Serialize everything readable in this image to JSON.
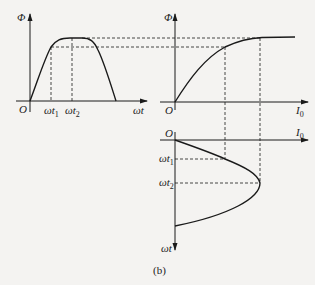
{
  "figure": {
    "caption": "(b)",
    "left_plot": {
      "y_label": "Φ",
      "x_label": "ωt",
      "origin_label": "O",
      "tick1": {
        "base": "ωt",
        "sub": "1"
      },
      "tick2": {
        "base": "ωt",
        "sub": "2"
      }
    },
    "right_top_plot": {
      "y_label": "Φ",
      "x_label_base": "I",
      "x_label_sub": "0",
      "origin_label": "O"
    },
    "right_bottom_plot": {
      "x_label_base": "I",
      "x_label_sub": "0",
      "y_label": "ωt",
      "origin_label": "O",
      "tick1": {
        "base": "ωt",
        "sub": "1"
      },
      "tick2": {
        "base": "ωt",
        "sub": "2"
      }
    }
  },
  "colors": {
    "line": "#1a1a1a",
    "background": "#f4f3f1"
  }
}
